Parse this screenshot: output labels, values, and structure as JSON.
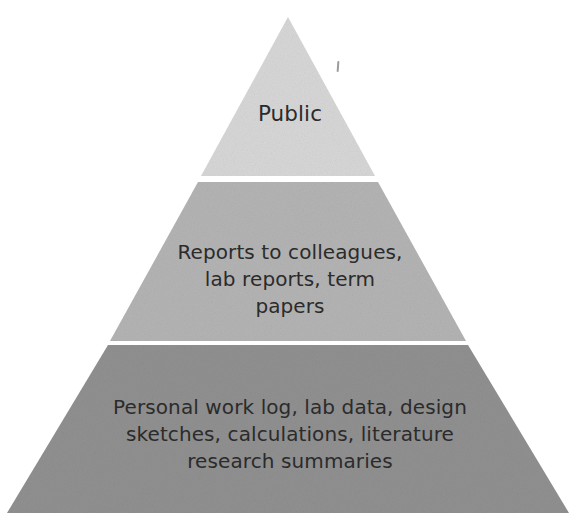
{
  "figure": {
    "type": "pyramid-diagram",
    "background_color": "#ffffff",
    "text_color": "#2b2b2b",
    "tiers": [
      {
        "id": "top",
        "level": 1,
        "label": "Public",
        "fill_color": "#d8d8d8",
        "audience_scope": "widest / most public"
      },
      {
        "id": "middle",
        "level": 2,
        "label": "Reports to colleagues,\nlab reports, term\npapers",
        "fill_color": "#b4b4b4",
        "audience_scope": "colleagues and instructors"
      },
      {
        "id": "bottom",
        "level": 3,
        "label": "Personal work log, lab data, design\nsketches, calculations, literature\nresearch summaries",
        "fill_color": "#909090",
        "audience_scope": "personal / private"
      }
    ],
    "artifact": {
      "name": "scan-tick-mark",
      "color": "#8a8a8a"
    }
  }
}
